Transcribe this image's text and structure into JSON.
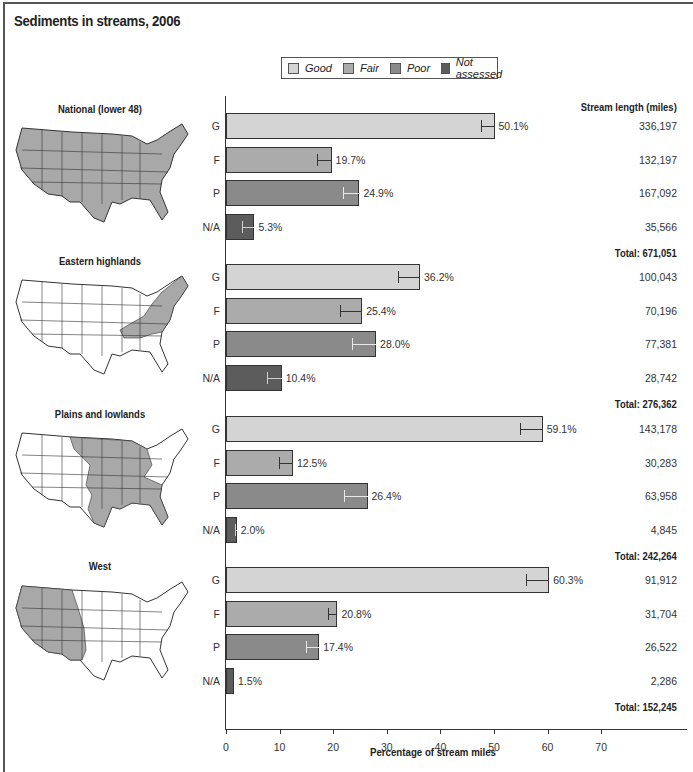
{
  "title": "Sediments in streams, 2006",
  "legend": [
    {
      "label": "Good",
      "color": "#d4d4d4"
    },
    {
      "label": "Fair",
      "color": "#ababab"
    },
    {
      "label": "Poor",
      "color": "#8a8a8a"
    },
    {
      "label": "Not assessed",
      "color": "#5c5c5c"
    }
  ],
  "stream_length_header": "Stream length (miles)",
  "x_axis": {
    "label": "Percentage of stream miles",
    "ticks": [
      "0",
      "10",
      "20",
      "30",
      "40",
      "50",
      "60",
      "70"
    ]
  },
  "regions": [
    {
      "name": "National (lower 48)",
      "total": "Total: 671,051"
    },
    {
      "name": "Eastern highlands",
      "total": "Total: 276,362"
    },
    {
      "name": "Plains and lowlands",
      "total": "Total: 242,264"
    },
    {
      "name": "West",
      "total": "Total: 152,245"
    }
  ],
  "chart_data": {
    "type": "bar",
    "orientation": "horizontal",
    "title": "Sediments in streams, 2006",
    "xlabel": "Percentage of stream miles",
    "ylabel": "",
    "xlim": [
      0,
      70
    ],
    "x_ticks": [
      0,
      10,
      20,
      30,
      40,
      50,
      60,
      70
    ],
    "categories": [
      "G",
      "F",
      "P",
      "N/A"
    ],
    "category_names": [
      "Good",
      "Fair",
      "Poor",
      "Not assessed"
    ],
    "legend_position": "top",
    "grid": false,
    "groups": [
      {
        "region": "National (lower 48)",
        "values": [
          50.1,
          19.7,
          24.9,
          5.3
        ],
        "labels": [
          "50.1%",
          "19.7%",
          "24.9%",
          "5.3%"
        ],
        "error_low": [
          47.5,
          17.0,
          21.8,
          3.0
        ],
        "stream_miles": [
          "336,197",
          "132,197",
          "167,092",
          "35,566"
        ],
        "total_miles": "Total: 671,051"
      },
      {
        "region": "Eastern highlands",
        "values": [
          36.2,
          25.4,
          28.0,
          10.4
        ],
        "labels": [
          "36.2%",
          "25.4%",
          "28.0%",
          "10.4%"
        ],
        "error_low": [
          32.0,
          21.2,
          23.6,
          7.6
        ],
        "stream_miles": [
          "100,043",
          "70,196",
          "77,381",
          "28,742"
        ],
        "total_miles": "Total: 276,362"
      },
      {
        "region": "Plains and lowlands",
        "values": [
          59.1,
          12.5,
          26.4,
          2.0
        ],
        "labels": [
          "59.1%",
          "12.5%",
          "26.4%",
          "2.0%"
        ],
        "error_low": [
          54.8,
          9.8,
          22.1,
          1.6
        ],
        "stream_miles": [
          "143,178",
          "30,283",
          "63,958",
          "4,845"
        ],
        "total_miles": "Total: 242,264"
      },
      {
        "region": "West",
        "values": [
          60.3,
          20.8,
          17.4,
          1.5
        ],
        "labels": [
          "60.3%",
          "20.8%",
          "17.4%",
          "1.5%"
        ],
        "error_low": [
          56.0,
          19.0,
          15.0,
          1.5
        ],
        "stream_miles": [
          "91,912",
          "31,704",
          "26,522",
          "2,286"
        ],
        "total_miles": "Total: 152,245"
      }
    ]
  }
}
